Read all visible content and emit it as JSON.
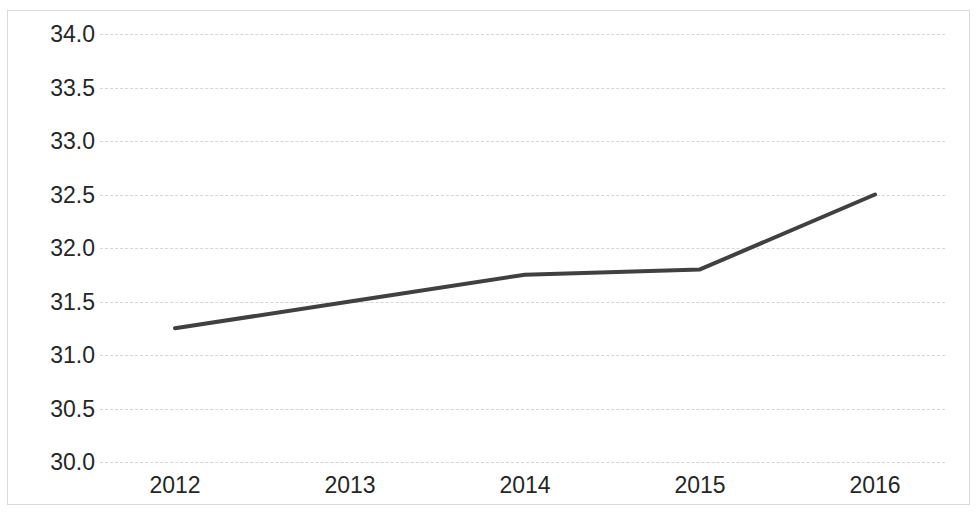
{
  "chart_data": {
    "type": "line",
    "title": "",
    "subtitle": "",
    "xlabel": "",
    "ylabel": "",
    "categories": [
      "2012",
      "2013",
      "2014",
      "2015",
      "2016"
    ],
    "x": [
      2012,
      2013,
      2014,
      2015,
      2016
    ],
    "values": [
      31.25,
      31.5,
      31.75,
      31.8,
      32.5
    ],
    "series": [
      {
        "name": "",
        "values": [
          31.25,
          31.5,
          31.75,
          31.8,
          32.5
        ]
      }
    ],
    "ylim": [
      30.0,
      34.0
    ],
    "ytick_step": 0.5,
    "yticks": [
      "34.0",
      "33.5",
      "33.0",
      "32.5",
      "32.0",
      "31.5",
      "31.0",
      "30.5",
      "30.0"
    ],
    "ytick_values": [
      34.0,
      33.5,
      33.0,
      32.5,
      32.0,
      31.5,
      31.0,
      30.5,
      30.0
    ],
    "xticks": [
      "2012",
      "2013",
      "2014",
      "2015",
      "2016"
    ],
    "grid": {
      "horizontal": true,
      "vertical": false,
      "style": "dashed",
      "color": "#d6d6d6"
    },
    "legend": {
      "visible": false,
      "position": "none",
      "entries": []
    },
    "markers": false,
    "line_color": "#404040",
    "line_width": 4,
    "background_color": "#ffffff",
    "border_color": "#d9d9d9",
    "tick_label_color": "#262626",
    "annotations": []
  }
}
